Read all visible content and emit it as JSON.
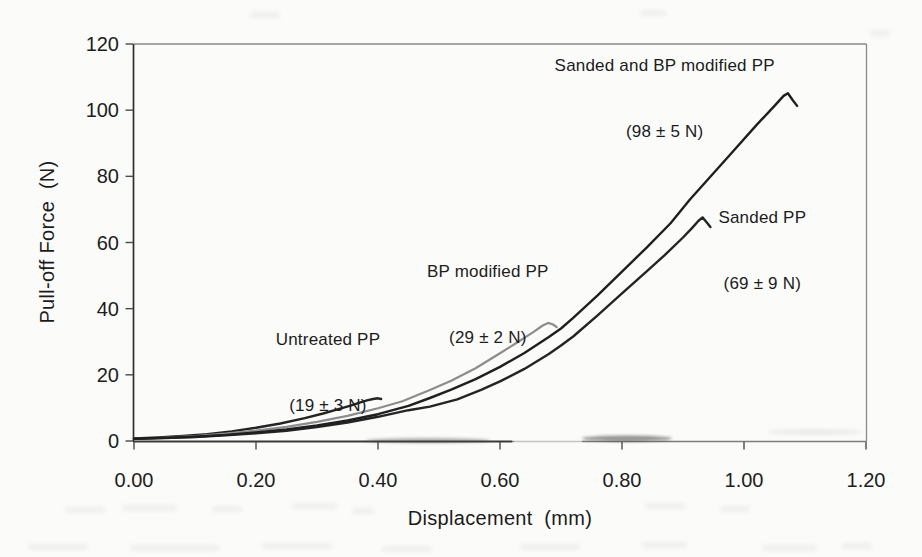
{
  "chart_data": {
    "type": "line",
    "title": "",
    "xlabel": "Displacement  (mm)",
    "ylabel": "Pull-off Force  (N)",
    "xlim": [
      0,
      1.2
    ],
    "ylim": [
      0,
      120
    ],
    "x_ticks": [
      0.0,
      0.2,
      0.4,
      0.6,
      0.8,
      1.0,
      1.2
    ],
    "x_tick_labels": [
      "0.00",
      "0.20",
      "0.40",
      "0.60",
      "0.80",
      "1.00",
      "1.20"
    ],
    "y_ticks": [
      0,
      20,
      40,
      60,
      80,
      100,
      120
    ],
    "y_tick_labels": [
      "0",
      "20",
      "40",
      "60",
      "80",
      "100",
      "120"
    ],
    "grid": false,
    "legend_position": "none (inline text annotations next to each curve)",
    "colors": {
      "axis": "#2e2e2e",
      "frame": "#8a8a8a",
      "text": "#1d1d1d",
      "background": "#fbfbfa"
    },
    "series": [
      {
        "name": "Untreated PP",
        "reported_pulloff": "19 ± 3 N",
        "color": "#232323",
        "points": [
          [
            0,
            0.8
          ],
          [
            0.04,
            1.1
          ],
          [
            0.08,
            1.5
          ],
          [
            0.12,
            2.1
          ],
          [
            0.16,
            2.9
          ],
          [
            0.2,
            4.0
          ],
          [
            0.24,
            5.3
          ],
          [
            0.28,
            6.9
          ],
          [
            0.31,
            8.3
          ],
          [
            0.335,
            9.6
          ],
          [
            0.355,
            10.7
          ],
          [
            0.37,
            11.6
          ],
          [
            0.382,
            12.3
          ],
          [
            0.392,
            12.7
          ],
          [
            0.4,
            12.9
          ],
          [
            0.405,
            12.7
          ]
        ]
      },
      {
        "name": "BP modified PP",
        "reported_pulloff": "29 ± 2 N",
        "color": "#8d8d8d",
        "points": [
          [
            0,
            0.7
          ],
          [
            0.05,
            1.0
          ],
          [
            0.1,
            1.5
          ],
          [
            0.15,
            2.2
          ],
          [
            0.2,
            3.1
          ],
          [
            0.25,
            4.3
          ],
          [
            0.3,
            5.8
          ],
          [
            0.35,
            7.6
          ],
          [
            0.4,
            9.9
          ],
          [
            0.44,
            12.0
          ],
          [
            0.485,
            15.4
          ],
          [
            0.52,
            18.2
          ],
          [
            0.56,
            22.0
          ],
          [
            0.6,
            26.5
          ],
          [
            0.63,
            30.0
          ],
          [
            0.655,
            33.0
          ],
          [
            0.67,
            34.9
          ],
          [
            0.679,
            35.7
          ],
          [
            0.687,
            35.2
          ],
          [
            0.693,
            34.4
          ]
        ]
      },
      {
        "name": "Sanded PP",
        "reported_pulloff": "69 ± 9 N",
        "color": "#242424",
        "points": [
          [
            0,
            0.7
          ],
          [
            0.05,
            0.9
          ],
          [
            0.1,
            1.2
          ],
          [
            0.15,
            1.7
          ],
          [
            0.2,
            2.3
          ],
          [
            0.25,
            3.1
          ],
          [
            0.3,
            4.2
          ],
          [
            0.35,
            5.6
          ],
          [
            0.4,
            7.3
          ],
          [
            0.45,
            9.3
          ],
          [
            0.485,
            10.4
          ],
          [
            0.53,
            12.6
          ],
          [
            0.57,
            15.5
          ],
          [
            0.6,
            18.0
          ],
          [
            0.64,
            21.8
          ],
          [
            0.68,
            26.3
          ],
          [
            0.7,
            28.9
          ],
          [
            0.72,
            31.6
          ],
          [
            0.76,
            38.0
          ],
          [
            0.8,
            44.6
          ],
          [
            0.84,
            51.2
          ],
          [
            0.87,
            56.2
          ],
          [
            0.9,
            61.5
          ],
          [
            0.915,
            64.4
          ],
          [
            0.925,
            66.5
          ],
          [
            0.932,
            67.6
          ],
          [
            0.938,
            66.3
          ],
          [
            0.945,
            64.7
          ]
        ]
      },
      {
        "name": "Sanded and BP modified PP",
        "reported_pulloff": "98 ± 5 N",
        "color": "#1f1f1f",
        "points": [
          [
            0,
            0.7
          ],
          [
            0.05,
            0.95
          ],
          [
            0.1,
            1.3
          ],
          [
            0.15,
            1.85
          ],
          [
            0.2,
            2.6
          ],
          [
            0.25,
            3.5
          ],
          [
            0.3,
            4.7
          ],
          [
            0.35,
            6.2
          ],
          [
            0.4,
            8.1
          ],
          [
            0.45,
            10.6
          ],
          [
            0.485,
            13.0
          ],
          [
            0.52,
            15.5
          ],
          [
            0.56,
            18.7
          ],
          [
            0.6,
            22.4
          ],
          [
            0.64,
            26.6
          ],
          [
            0.68,
            31.4
          ],
          [
            0.7,
            34.0
          ],
          [
            0.72,
            37.2
          ],
          [
            0.76,
            44.0
          ],
          [
            0.8,
            51.2
          ],
          [
            0.84,
            58.4
          ],
          [
            0.88,
            65.9
          ],
          [
            0.911,
            72.9
          ],
          [
            0.94,
            78.9
          ],
          [
            0.98,
            87.1
          ],
          [
            1.02,
            95.4
          ],
          [
            1.05,
            101.3
          ],
          [
            1.065,
            104.3
          ],
          [
            1.072,
            105.1
          ],
          [
            1.08,
            103.0
          ],
          [
            1.087,
            101.3
          ]
        ]
      }
    ],
    "annotations": [
      {
        "line1": "Untreated PP",
        "line2": "(19 ± 3 N)",
        "x": 0.318,
        "y": 20.6
      },
      {
        "line1": "BP modified PP",
        "line2": "(29 ± 2 N)",
        "x": 0.58,
        "y": 41.0
      },
      {
        "line1": "Sanded and BP modified PP",
        "line2": "(98 ± 5 N)",
        "x": 0.87,
        "y": 103.5
      },
      {
        "line1": "Sanded PP",
        "line2": "(69 ± 9 N)",
        "x": 1.03,
        "y": 57.5
      }
    ]
  }
}
